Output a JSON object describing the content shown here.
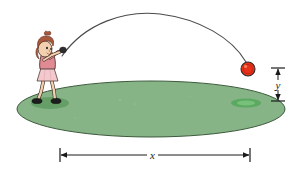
{
  "figure": {
    "background_color": "#ffffff",
    "width": 301,
    "height": 169
  },
  "labels": {
    "horizontal_distance": "x",
    "vertical_distance": "y"
  },
  "elements": {
    "field": {
      "name": "green-elliptical-field",
      "fill_color": "#86b487",
      "stroke_color": "#3d5a3d",
      "center_x": 151,
      "center_y": 109,
      "radius_x": 134,
      "radius_y": 28
    },
    "ball": {
      "name": "red-ball",
      "fill_color": "#e8311a",
      "stroke_color": "#2b2b2b",
      "center_x": 248,
      "center_y": 69,
      "radius": 7
    },
    "trajectory": {
      "name": "ball-trajectory-arc",
      "stroke_color": "#4a4a4a",
      "start_x": 62,
      "start_y": 56,
      "apex_x": 160,
      "apex_y": 14,
      "end_x": 246,
      "end_y": 62
    },
    "thrower": {
      "name": "person-throwing-ball",
      "hair_color": "#a8593c",
      "skin_color": "#f2cfae",
      "shirt_color": "#e08a93",
      "skirt_color": "#f3c9ce",
      "shoe_color": "#1d1d1d",
      "outline_color": "#3a2a22"
    },
    "shadows": {
      "feet_shadow_color": "#5f9a61",
      "landing_spot_color": "#5aa95f"
    },
    "x_dimension": {
      "name": "x-dimension-line",
      "left_x": 60,
      "right_x": 250,
      "y": 155,
      "stroke_color": "#1a1a1a"
    },
    "y_dimension": {
      "name": "y-dimension-line",
      "x": 278,
      "top_y": 68,
      "bottom_y": 101,
      "stroke_color": "#1a1a1a"
    }
  }
}
